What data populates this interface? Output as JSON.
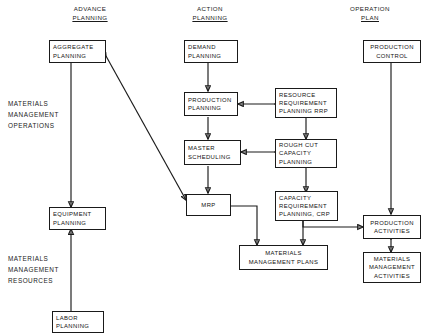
{
  "diagram": {
    "column_headers": [
      {
        "id": "advance-planning",
        "line1": "ADVANCE",
        "line2": "PLANNING"
      },
      {
        "id": "action-planning",
        "line1": "ACTION",
        "line2": "PLANNING"
      },
      {
        "id": "operation-plan",
        "line1": "OPERATION",
        "line2": "PLAN"
      }
    ],
    "side_labels": [
      {
        "id": "materials-management-operations",
        "lines": [
          "MATERIALS",
          "MANAGEMENT",
          "OPERATIONS"
        ]
      },
      {
        "id": "materials-management-resources",
        "lines": [
          "MATERIALS",
          "MANAGEMENT",
          "RESOURCES"
        ]
      }
    ],
    "nodes": [
      {
        "id": "aggregate-planning",
        "lines": [
          "AGGREGATE",
          "PLANNING"
        ]
      },
      {
        "id": "equipment-planning",
        "lines": [
          "EQUIPMENT",
          "PLANNING"
        ]
      },
      {
        "id": "labor-planning",
        "lines": [
          "LABOR",
          "PLANNING"
        ]
      },
      {
        "id": "demand-planning",
        "lines": [
          "DEMAND",
          "PLANNING"
        ]
      },
      {
        "id": "production-planning",
        "lines": [
          "PRODUCTION",
          "PLANNING"
        ]
      },
      {
        "id": "master-scheduling",
        "lines": [
          "MASTER",
          "SCHEDULING"
        ]
      },
      {
        "id": "mrp",
        "lines": [
          "MRP"
        ]
      },
      {
        "id": "resource-requirement-planning",
        "lines": [
          "RESOURCE",
          "REQUIREMENT",
          "PLANNING RRP"
        ]
      },
      {
        "id": "rough-cut-capacity-planning",
        "lines": [
          "ROUGH CUT",
          "CAPACITY",
          "PLANNING"
        ]
      },
      {
        "id": "capacity-requirement-planning",
        "lines": [
          "CAPACITY",
          "REQUIREMENT",
          "PLANNING, CRP"
        ]
      },
      {
        "id": "materials-management-plans",
        "lines": [
          "MATERIALS",
          "MANAGEMENT PLANS"
        ]
      },
      {
        "id": "production-control",
        "lines": [
          "PRODUCTION",
          "CONTROL"
        ]
      },
      {
        "id": "production-activities",
        "lines": [
          "PRODUCTION",
          "ACTIVITIES"
        ]
      },
      {
        "id": "materials-management-activities",
        "lines": [
          "MATERIALS",
          "MANAGEMENT",
          "ACTIVITIES"
        ]
      }
    ],
    "edges": [
      {
        "from": "aggregate-planning",
        "to": "equipment-planning",
        "direction": "one-way"
      },
      {
        "from": "labor-planning",
        "to": "equipment-planning",
        "direction": "one-way"
      },
      {
        "from": "aggregate-planning",
        "to": "mrp",
        "direction": "two-way"
      },
      {
        "from": "demand-planning",
        "to": "production-planning",
        "direction": "one-way"
      },
      {
        "from": "resource-requirement-planning",
        "to": "production-planning",
        "direction": "two-way"
      },
      {
        "from": "production-planning",
        "to": "master-scheduling",
        "direction": "one-way"
      },
      {
        "from": "resource-requirement-planning",
        "to": "rough-cut-capacity-planning",
        "direction": "one-way"
      },
      {
        "from": "rough-cut-capacity-planning",
        "to": "master-scheduling",
        "direction": "two-way"
      },
      {
        "from": "master-scheduling",
        "to": "mrp",
        "direction": "one-way"
      },
      {
        "from": "rough-cut-capacity-planning",
        "to": "capacity-requirement-planning",
        "direction": "one-way"
      },
      {
        "from": "mrp",
        "to": "materials-management-plans",
        "direction": "one-way"
      },
      {
        "from": "capacity-requirement-planning",
        "to": "materials-management-plans",
        "direction": "one-way"
      },
      {
        "from": "capacity-requirement-planning",
        "to": "production-activities",
        "direction": "one-way"
      },
      {
        "from": "production-control",
        "to": "production-activities",
        "direction": "one-way"
      },
      {
        "from": "production-activities",
        "to": "materials-management-activities",
        "direction": "two-way"
      }
    ],
    "colors": {
      "background": "#ffffff",
      "stroke": "#1a1a1a",
      "text": "#111111"
    }
  }
}
